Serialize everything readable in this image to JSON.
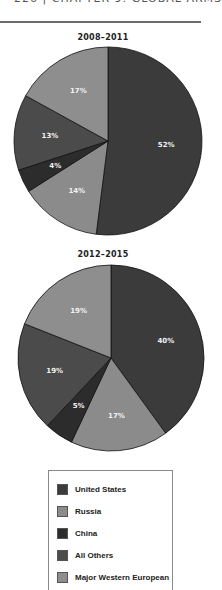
{
  "page": {
    "header_text": "226 | CHAPTER 9: GLOBAL ARMS",
    "colors": {
      "United States": "#3b3b3b",
      "Russia": "#8b8b8b",
      "China": "#2c2c2c",
      "All Others": "#4b4b4b",
      "Major Western European": "#8e8e8e",
      "slice_border": "#111111"
    }
  },
  "legend": {
    "items": [
      {
        "label": "United States",
        "color": "#3b3b3b"
      },
      {
        "label": "Russia",
        "color": "#8b8b8b"
      },
      {
        "label": "China",
        "color": "#2c2c2c"
      },
      {
        "label": "All Others",
        "color": "#4b4b4b"
      },
      {
        "label": "Major Western European",
        "color": "#8e8e8e"
      }
    ]
  },
  "chart_data": [
    {
      "type": "pie",
      "title": "2008–2011",
      "categories": [
        "United States",
        "Russia",
        "China",
        "All Others",
        "Major Western European"
      ],
      "values": [
        52,
        14,
        4,
        13,
        17
      ],
      "labels": [
        "52%",
        "14%",
        "4%",
        "13%",
        "17%"
      ],
      "start_angle": "12 o'clock, clockwise",
      "legend_position": "bottom"
    },
    {
      "type": "pie",
      "title": "2012–2015",
      "categories": [
        "United States",
        "Russia",
        "China",
        "All Others",
        "Major Western European"
      ],
      "values": [
        40,
        17,
        5,
        19,
        19
      ],
      "labels": [
        "40%",
        "17%",
        "5%",
        "19%",
        "19%"
      ],
      "start_angle": "12 o'clock, clockwise",
      "legend_position": "bottom"
    }
  ]
}
